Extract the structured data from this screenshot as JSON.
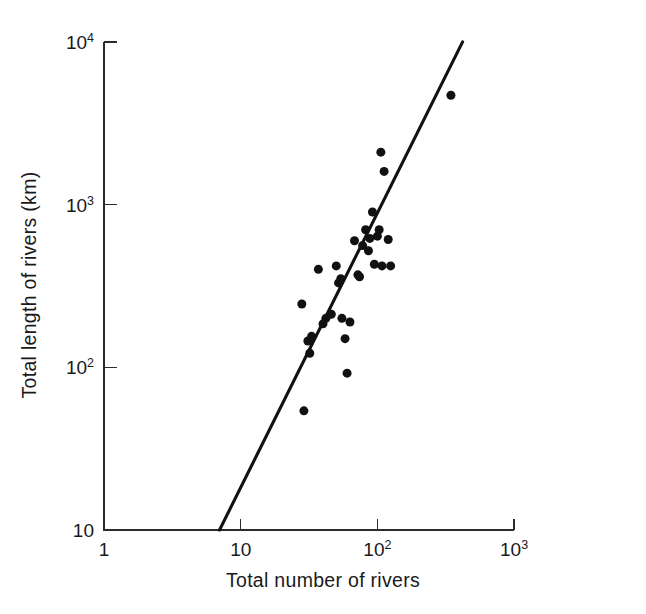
{
  "figure": {
    "background_color": "#ffffff",
    "ink_color": "#111111"
  },
  "chart_data": {
    "type": "scatter",
    "title": "",
    "subtitle": "",
    "xlabel": "Total number of rivers",
    "ylabel": "Total length of rivers (km)",
    "xscale": "log",
    "yscale": "log",
    "xlim": [
      1,
      1000
    ],
    "ylim": [
      10,
      10000
    ],
    "grid": false,
    "legend": null,
    "xticks": [
      1,
      10,
      100,
      1000
    ],
    "xtick_labels": [
      "1",
      "10",
      "10²",
      "10³"
    ],
    "xtick_label_parts": [
      {
        "base": "1",
        "exp": ""
      },
      {
        "base": "10",
        "exp": ""
      },
      {
        "base": "10",
        "exp": "2"
      },
      {
        "base": "10",
        "exp": "3"
      }
    ],
    "yticks": [
      10,
      100,
      1000,
      10000
    ],
    "ytick_labels": [
      "10",
      "10²",
      "10³",
      "10⁴"
    ],
    "ytick_label_parts": [
      {
        "base": "10",
        "exp": ""
      },
      {
        "base": "10",
        "exp": "2"
      },
      {
        "base": "10",
        "exp": "3"
      },
      {
        "base": "10",
        "exp": "4"
      }
    ],
    "marker": "filled-circle",
    "marker_size_px": 9,
    "marker_color": "#111111",
    "points": [
      {
        "x": 28,
        "y": 245
      },
      {
        "x": 29,
        "y": 54
      },
      {
        "x": 31,
        "y": 145
      },
      {
        "x": 32,
        "y": 122
      },
      {
        "x": 33,
        "y": 155
      },
      {
        "x": 37,
        "y": 400
      },
      {
        "x": 40,
        "y": 185
      },
      {
        "x": 42,
        "y": 200
      },
      {
        "x": 46,
        "y": 212
      },
      {
        "x": 50,
        "y": 420
      },
      {
        "x": 52,
        "y": 330
      },
      {
        "x": 54,
        "y": 350
      },
      {
        "x": 55,
        "y": 200
      },
      {
        "x": 58,
        "y": 150
      },
      {
        "x": 60,
        "y": 92
      },
      {
        "x": 63,
        "y": 190
      },
      {
        "x": 68,
        "y": 600
      },
      {
        "x": 72,
        "y": 370
      },
      {
        "x": 74,
        "y": 360
      },
      {
        "x": 78,
        "y": 560
      },
      {
        "x": 82,
        "y": 700
      },
      {
        "x": 86,
        "y": 520
      },
      {
        "x": 88,
        "y": 620
      },
      {
        "x": 92,
        "y": 900
      },
      {
        "x": 95,
        "y": 430
      },
      {
        "x": 100,
        "y": 640
      },
      {
        "x": 103,
        "y": 700
      },
      {
        "x": 106,
        "y": 2100
      },
      {
        "x": 108,
        "y": 420
      },
      {
        "x": 112,
        "y": 1600
      },
      {
        "x": 120,
        "y": 610
      },
      {
        "x": 125,
        "y": 420
      },
      {
        "x": 345,
        "y": 4700
      }
    ],
    "trend_line": {
      "type": "power-law-fit",
      "start": {
        "x": 7.0,
        "y": 10
      },
      "end": {
        "x": 420,
        "y": 10000
      }
    }
  }
}
